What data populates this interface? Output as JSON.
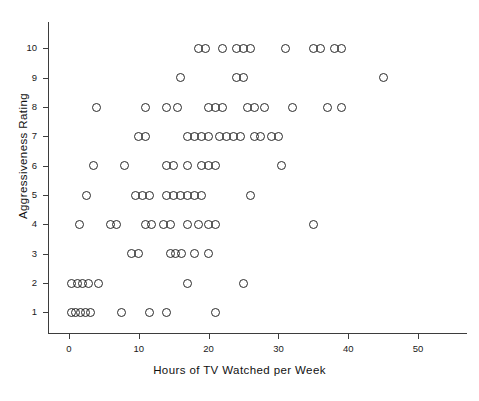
{
  "chart_data": {
    "type": "scatter",
    "title": "",
    "xlabel": "Hours of TV Watched per Week",
    "ylabel": "Aggressiveness Rating",
    "xlim": [
      -3,
      57
    ],
    "ylim": [
      0.3,
      10.9
    ],
    "grid": false,
    "legend": null,
    "xticks": [
      0,
      10,
      20,
      30,
      40,
      50
    ],
    "xticklabels": [
      "0",
      "10",
      "20",
      "30",
      "40",
      "50"
    ],
    "yticks": [
      1,
      2,
      3,
      4,
      5,
      6,
      7,
      8,
      9,
      10
    ],
    "yticklabels": [
      "1",
      "2",
      "3",
      "4",
      "5",
      "6",
      "7",
      "8",
      "9",
      "10"
    ],
    "marker": "open-circle",
    "marker_color": "#2a2a2a",
    "points": [
      {
        "x": 18.5,
        "y": 10
      },
      {
        "x": 19.5,
        "y": 10
      },
      {
        "x": 22.0,
        "y": 10
      },
      {
        "x": 24.0,
        "y": 10
      },
      {
        "x": 25.0,
        "y": 10
      },
      {
        "x": 26.0,
        "y": 10
      },
      {
        "x": 31.0,
        "y": 10
      },
      {
        "x": 35.0,
        "y": 10
      },
      {
        "x": 36.0,
        "y": 10
      },
      {
        "x": 38.0,
        "y": 10
      },
      {
        "x": 39.0,
        "y": 10
      },
      {
        "x": 16.0,
        "y": 9
      },
      {
        "x": 24.0,
        "y": 9
      },
      {
        "x": 25.0,
        "y": 9
      },
      {
        "x": 45.0,
        "y": 9
      },
      {
        "x": 4.0,
        "y": 8
      },
      {
        "x": 11.0,
        "y": 8
      },
      {
        "x": 14.0,
        "y": 8
      },
      {
        "x": 15.5,
        "y": 8
      },
      {
        "x": 20.0,
        "y": 8
      },
      {
        "x": 21.0,
        "y": 8
      },
      {
        "x": 22.0,
        "y": 8
      },
      {
        "x": 25.5,
        "y": 8
      },
      {
        "x": 26.5,
        "y": 8
      },
      {
        "x": 28.0,
        "y": 8
      },
      {
        "x": 32.0,
        "y": 8
      },
      {
        "x": 37.0,
        "y": 8
      },
      {
        "x": 39.0,
        "y": 8
      },
      {
        "x": 10.0,
        "y": 7
      },
      {
        "x": 11.0,
        "y": 7
      },
      {
        "x": 17.0,
        "y": 7
      },
      {
        "x": 18.0,
        "y": 7
      },
      {
        "x": 19.0,
        "y": 7
      },
      {
        "x": 20.0,
        "y": 7
      },
      {
        "x": 21.5,
        "y": 7
      },
      {
        "x": 22.5,
        "y": 7
      },
      {
        "x": 23.5,
        "y": 7
      },
      {
        "x": 24.5,
        "y": 7
      },
      {
        "x": 26.5,
        "y": 7
      },
      {
        "x": 27.5,
        "y": 7
      },
      {
        "x": 29.0,
        "y": 7
      },
      {
        "x": 30.0,
        "y": 7
      },
      {
        "x": 3.5,
        "y": 6
      },
      {
        "x": 8.0,
        "y": 6
      },
      {
        "x": 14.0,
        "y": 6
      },
      {
        "x": 15.0,
        "y": 6
      },
      {
        "x": 17.0,
        "y": 6
      },
      {
        "x": 19.0,
        "y": 6
      },
      {
        "x": 20.0,
        "y": 6
      },
      {
        "x": 21.0,
        "y": 6
      },
      {
        "x": 30.5,
        "y": 6
      },
      {
        "x": 2.5,
        "y": 5
      },
      {
        "x": 9.5,
        "y": 5
      },
      {
        "x": 10.5,
        "y": 5
      },
      {
        "x": 11.5,
        "y": 5
      },
      {
        "x": 14.0,
        "y": 5
      },
      {
        "x": 15.0,
        "y": 5
      },
      {
        "x": 16.0,
        "y": 5
      },
      {
        "x": 17.0,
        "y": 5
      },
      {
        "x": 18.0,
        "y": 5
      },
      {
        "x": 19.0,
        "y": 5
      },
      {
        "x": 26.0,
        "y": 5
      },
      {
        "x": 1.5,
        "y": 4
      },
      {
        "x": 6.0,
        "y": 4
      },
      {
        "x": 6.8,
        "y": 4
      },
      {
        "x": 11.0,
        "y": 4
      },
      {
        "x": 11.8,
        "y": 4
      },
      {
        "x": 13.5,
        "y": 4
      },
      {
        "x": 14.5,
        "y": 4
      },
      {
        "x": 17.0,
        "y": 4
      },
      {
        "x": 18.5,
        "y": 4
      },
      {
        "x": 20.0,
        "y": 4
      },
      {
        "x": 21.0,
        "y": 4
      },
      {
        "x": 35.0,
        "y": 4
      },
      {
        "x": 9.0,
        "y": 3
      },
      {
        "x": 10.0,
        "y": 3
      },
      {
        "x": 14.5,
        "y": 3
      },
      {
        "x": 15.3,
        "y": 3
      },
      {
        "x": 16.1,
        "y": 3
      },
      {
        "x": 18.0,
        "y": 3
      },
      {
        "x": 20.0,
        "y": 3
      },
      {
        "x": 0.3,
        "y": 2
      },
      {
        "x": 1.2,
        "y": 2
      },
      {
        "x": 2.0,
        "y": 2
      },
      {
        "x": 2.8,
        "y": 2
      },
      {
        "x": 4.2,
        "y": 2
      },
      {
        "x": 17.0,
        "y": 2
      },
      {
        "x": 25.0,
        "y": 2
      },
      {
        "x": 0.3,
        "y": 1
      },
      {
        "x": 1.0,
        "y": 1
      },
      {
        "x": 1.7,
        "y": 1
      },
      {
        "x": 2.4,
        "y": 1
      },
      {
        "x": 3.1,
        "y": 1
      },
      {
        "x": 7.5,
        "y": 1
      },
      {
        "x": 11.5,
        "y": 1
      },
      {
        "x": 14.0,
        "y": 1
      },
      {
        "x": 21.0,
        "y": 1
      }
    ]
  }
}
